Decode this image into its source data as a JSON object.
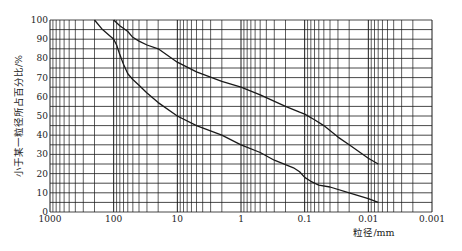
{
  "chart_data": {
    "type": "line",
    "title": "",
    "xlabel": "粒径/mm",
    "ylabel": "小于某一粒径所占百分比/%",
    "xscale": "log",
    "x_reversed": true,
    "xlim": [
      1000,
      0.001
    ],
    "ylim": [
      0,
      100
    ],
    "x_ticks": [
      "1000",
      "100",
      "10",
      "1",
      "0.1",
      "0.01",
      "0.001"
    ],
    "x_tick_values": [
      1000,
      100,
      10,
      1,
      0.1,
      0.01,
      0.001
    ],
    "y_ticks": [
      "0",
      "10",
      "20",
      "30",
      "40",
      "50",
      "60",
      "70",
      "80",
      "90",
      "100"
    ],
    "y_tick_values": [
      0,
      10,
      20,
      30,
      40,
      50,
      60,
      70,
      80,
      90,
      100
    ],
    "grid": {
      "horizontal_step": 5,
      "vertical": "log minor (1-9 per decade)"
    },
    "legend": null,
    "series": [
      {
        "name": "upper envelope",
        "x": [
          100,
          80,
          60,
          50,
          40,
          30,
          20,
          10,
          5,
          2,
          1,
          0.5,
          0.2,
          0.12,
          0.1,
          0.07,
          0.05,
          0.03,
          0.02,
          0.01,
          0.007
        ],
        "y": [
          100,
          97,
          94,
          91,
          89,
          87,
          85,
          78,
          73,
          68,
          65,
          61,
          55,
          52,
          51,
          48,
          45,
          39,
          35,
          28,
          25
        ]
      },
      {
        "name": "lower envelope",
        "x": [
          200,
          150,
          100,
          90,
          80,
          70,
          60,
          50,
          40,
          30,
          20,
          10,
          5,
          2,
          1,
          0.5,
          0.3,
          0.15,
          0.12,
          0.1,
          0.08,
          0.06,
          0.04,
          0.02,
          0.01,
          0.007
        ],
        "y": [
          100,
          95,
          90,
          87,
          82,
          77,
          72,
          69,
          66,
          62,
          57,
          50,
          45,
          40,
          35,
          31,
          27,
          23,
          21,
          18,
          16,
          14,
          13,
          10,
          7,
          5
        ]
      }
    ]
  },
  "colors": {
    "grid": "#1a1a1a",
    "curve": "#1a1a1a",
    "background": "#ffffff"
  }
}
